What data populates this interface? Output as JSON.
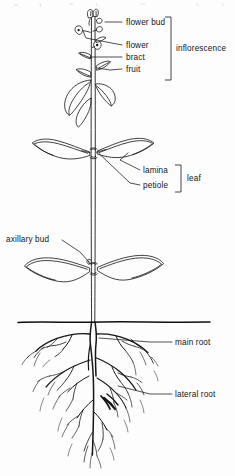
{
  "figure": {
    "style": "black ink line drawing on white ground",
    "width": 235,
    "height": 476,
    "ink_color": "#111111",
    "background_color": "#fdfdfd"
  },
  "labels": {
    "flower_bud": "flower bud",
    "flower": "flower",
    "bract": "bract",
    "fruit": "fruit",
    "inflorescence": "inflorescence",
    "lamina": "lamina",
    "petiole": "petiole",
    "leaf": "leaf",
    "axillary_bud": "axillary bud",
    "main_root": "main root",
    "lateral_root": "lateral root"
  },
  "groups": {
    "inflorescence_members": [
      "flower bud",
      "flower",
      "bract",
      "fruit"
    ],
    "leaf_members": [
      "lamina",
      "petiole"
    ]
  },
  "regions": {
    "shoot": "above soil line",
    "root": "below soil line",
    "soil_line_y": 322
  }
}
